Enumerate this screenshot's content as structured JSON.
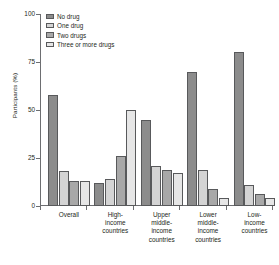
{
  "chart_data": {
    "type": "bar",
    "title": "",
    "subtitle": "",
    "xlabel": "",
    "ylabel": "Participants (%)",
    "ylim": [
      0,
      100
    ],
    "yticks": [
      0,
      25,
      50,
      75,
      100
    ],
    "grid": false,
    "legend_position": "top-left",
    "categories": [
      "Overall",
      "High-income countries",
      "Upper middle-income countries",
      "Lower middle-income countries",
      "Low-income countries"
    ],
    "category_lines": [
      [
        "Overall"
      ],
      [
        "High-",
        "income",
        "countries"
      ],
      [
        "Upper",
        "middle-",
        "income",
        "countries"
      ],
      [
        "Lower",
        "middle-",
        "income",
        "countries"
      ],
      [
        "Low-",
        "income",
        "countries"
      ]
    ],
    "series": [
      {
        "name": "No drug",
        "color": "#8c8c8c",
        "values": [
          58,
          12,
          45,
          70,
          80
        ]
      },
      {
        "name": "One drug",
        "color": "#d4d4d4",
        "values": [
          18,
          14,
          21,
          19,
          11
        ]
      },
      {
        "name": "Two drugs",
        "color": "#a8a8a8",
        "values": [
          13,
          26,
          19,
          9,
          6
        ]
      },
      {
        "name": "Three or more drugs",
        "color": "#e6e6e6",
        "values": [
          13,
          50,
          17,
          4,
          4
        ]
      }
    ]
  },
  "axis": {
    "y_title": "Participants (%)",
    "y_tick_labels": [
      "0",
      "25",
      "50",
      "75",
      "100"
    ]
  },
  "legend": {
    "items": [
      {
        "label": "No drug"
      },
      {
        "label": "One drug"
      },
      {
        "label": "Two drugs"
      },
      {
        "label": "Three or more drugs"
      }
    ]
  }
}
